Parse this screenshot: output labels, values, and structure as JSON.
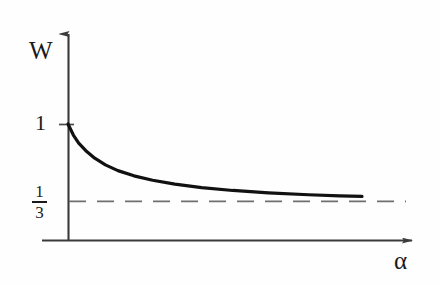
{
  "figure": {
    "title": "",
    "background_color": "#fefefe",
    "ink_color": "#1a1a1a",
    "asymptote_color": "#6f6f6f"
  },
  "labels": {
    "y_axis": "W",
    "x_axis": "α",
    "tick_one": "1",
    "fraction_numerator": "1",
    "fraction_denominator": "3"
  },
  "chart_data": {
    "type": "line",
    "title": "",
    "xlabel": "α",
    "ylabel": "W",
    "grid": false,
    "legend": null,
    "xlim": [
      0,
      3.6
    ],
    "ylim": [
      0,
      1.25
    ],
    "xticks": [],
    "yticks": [
      {
        "value": 1,
        "label": "1"
      },
      {
        "value": 0.3333,
        "label": "1/3"
      }
    ],
    "annotations": [
      {
        "text": "W",
        "role": "y-axis-label"
      },
      {
        "text": "α",
        "role": "x-axis-label"
      },
      {
        "text": "1",
        "role": "y-tick"
      },
      {
        "text": "1/3",
        "role": "y-tick"
      }
    ],
    "series": [
      {
        "name": "W(α)",
        "style": "solid",
        "color": "#111111",
        "width": 3.2,
        "description": "monotonically decreasing curve from W=1 at α=0 decaying toward the asymptote W=1/3",
        "x": [
          0.0,
          0.06,
          0.12,
          0.2,
          0.3,
          0.42,
          0.56,
          0.74,
          0.95,
          1.2,
          1.5,
          1.85,
          2.25,
          2.7,
          3.05,
          3.3
        ],
        "y": [
          1.0,
          0.905,
          0.835,
          0.77,
          0.705,
          0.648,
          0.598,
          0.553,
          0.515,
          0.481,
          0.452,
          0.427,
          0.406,
          0.39,
          0.381,
          0.376
        ]
      },
      {
        "name": "asymptote W = 1/3",
        "style": "dashed",
        "color": "#6f6f6f",
        "width": 1.6,
        "description": "horizontal dashed asymptote at W = 1/3",
        "x": [
          0.0,
          3.9
        ],
        "y": [
          0.3333,
          0.3333
        ]
      }
    ]
  },
  "geometry": {
    "origin_px": {
      "x": 68,
      "y": 240
    },
    "y_axis_top_px": 26,
    "x_axis_left_px": 42,
    "x_axis_right_px": 422,
    "y_one_px": 124,
    "y_third_px": 201,
    "curve_end_px": {
      "x": 362,
      "y": 198
    },
    "asymptote_end_px": 406
  }
}
